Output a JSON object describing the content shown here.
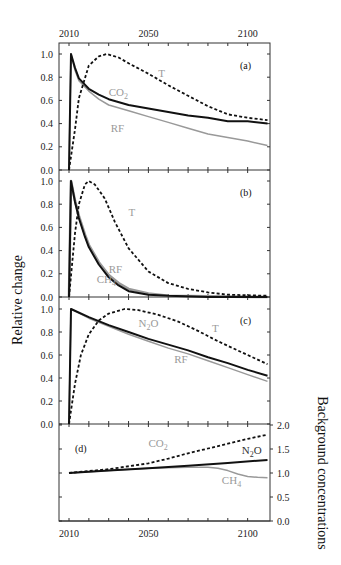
{
  "chart_data": {
    "type": "line",
    "ylabel_left": "Relative change",
    "ylabel_right": "Background concentrations",
    "xticks_top": [
      "2010",
      "2050",
      "2100"
    ],
    "xticks_bottom": [
      "2010",
      "2050",
      "2100"
    ],
    "xlim": [
      1995,
      2111
    ],
    "colors": {
      "dark": "#111111",
      "gray": "#999999"
    },
    "panels": [
      {
        "id": "a",
        "label": "(a)",
        "ylim": [
          0,
          1
        ],
        "yticks": [
          "0.0",
          "0.2",
          "0.4",
          "0.6",
          "0.8",
          "1.0"
        ],
        "series": [
          {
            "name": "RF",
            "label": "RF",
            "style": "gray-solid",
            "x": [
              2010,
              2011,
              2013,
              2015,
              2020,
              2025,
              2030,
              2040,
              2050,
              2060,
              2070,
              2080,
              2090,
              2100,
              2110
            ],
            "y": [
              0,
              1.0,
              0.86,
              0.77,
              0.68,
              0.61,
              0.56,
              0.51,
              0.46,
              0.41,
              0.36,
              0.31,
              0.28,
              0.25,
              0.21
            ]
          },
          {
            "name": "CO2",
            "label": "CO",
            "sub": "2",
            "style": "dark-solid",
            "x": [
              2010,
              2011,
              2013,
              2015,
              2020,
              2025,
              2030,
              2040,
              2050,
              2060,
              2070,
              2080,
              2090,
              2100,
              2110
            ],
            "y": [
              0,
              1.0,
              0.88,
              0.79,
              0.7,
              0.65,
              0.61,
              0.56,
              0.53,
              0.5,
              0.47,
              0.45,
              0.42,
              0.42,
              0.4
            ]
          },
          {
            "name": "T",
            "label": "T",
            "style": "dark-dashed",
            "x": [
              2010,
              2013,
              2015,
              2020,
              2025,
              2029,
              2035,
              2040,
              2050,
              2060,
              2070,
              2080,
              2090,
              2100,
              2110
            ],
            "y": [
              0,
              0.35,
              0.62,
              0.9,
              0.98,
              1.0,
              0.97,
              0.92,
              0.83,
              0.73,
              0.64,
              0.55,
              0.48,
              0.45,
              0.43
            ]
          }
        ],
        "annotations": [
          {
            "text": "T",
            "x": 2055,
            "y": 0.8,
            "color": "gray"
          },
          {
            "text": "CO",
            "sub": "2",
            "x": 2030,
            "y": 0.64,
            "color": "gray"
          },
          {
            "text": "RF",
            "x": 2031,
            "y": 0.33,
            "color": "gray"
          }
        ]
      },
      {
        "id": "b",
        "label": "(b)",
        "ylim": [
          0,
          1
        ],
        "yticks": [
          "0.0",
          "0.2",
          "0.4",
          "0.6",
          "0.8",
          "1.0"
        ],
        "series": [
          {
            "name": "RF",
            "label": "RF",
            "style": "gray-thick",
            "x": [
              2010,
              2011,
              2013,
              2015,
              2018,
              2020,
              2025,
              2030,
              2035,
              2040,
              2050,
              2060,
              2080,
              2110
            ],
            "y": [
              0,
              1.0,
              0.83,
              0.7,
              0.54,
              0.45,
              0.3,
              0.19,
              0.12,
              0.07,
              0.03,
              0.01,
              0.005,
              0.0
            ]
          },
          {
            "name": "CH4",
            "label": "CH",
            "sub": "4",
            "style": "dark-solid",
            "x": [
              2010,
              2011,
              2013,
              2015,
              2018,
              2020,
              2025,
              2030,
              2035,
              2040,
              2050,
              2060,
              2080,
              2110
            ],
            "y": [
              0,
              1.0,
              0.82,
              0.68,
              0.52,
              0.43,
              0.28,
              0.17,
              0.1,
              0.05,
              0.02,
              0.01,
              0.0,
              0.0
            ]
          },
          {
            "name": "T",
            "label": "T",
            "style": "dark-dashed",
            "x": [
              2010,
              2013,
              2015,
              2018,
              2020,
              2023,
              2028,
              2033,
              2040,
              2050,
              2060,
              2070,
              2080,
              2090,
              2110
            ],
            "y": [
              0,
              0.55,
              0.8,
              0.97,
              1.0,
              0.97,
              0.85,
              0.65,
              0.42,
              0.22,
              0.12,
              0.07,
              0.04,
              0.02,
              0.01
            ]
          }
        ],
        "annotations": [
          {
            "text": "T",
            "x": 2040,
            "y": 0.7,
            "color": "gray"
          },
          {
            "text": "RF",
            "x": 2030,
            "y": 0.21,
            "color": "gray"
          },
          {
            "text": "CH",
            "sub": "4",
            "x": 2024,
            "y": 0.12,
            "color": "gray"
          }
        ]
      },
      {
        "id": "c",
        "label": "(c)",
        "ylim": [
          0,
          1
        ],
        "yticks": [
          "0.0",
          "0.2",
          "0.4",
          "0.6",
          "0.8",
          "1.0"
        ],
        "series": [
          {
            "name": "RF",
            "label": "RF",
            "style": "gray-solid",
            "x": [
              2010,
              2011,
              2020,
              2030,
              2040,
              2050,
              2060,
              2070,
              2080,
              2090,
              2100,
              2110
            ],
            "y": [
              0,
              1.0,
              0.92,
              0.85,
              0.78,
              0.72,
              0.66,
              0.61,
              0.55,
              0.49,
              0.43,
              0.37
            ]
          },
          {
            "name": "N2O",
            "label": "N",
            "sub": "2",
            "suffix": "O",
            "style": "dark-solid",
            "x": [
              2010,
              2011,
              2020,
              2030,
              2040,
              2050,
              2060,
              2070,
              2080,
              2090,
              2100,
              2110
            ],
            "y": [
              0,
              1.0,
              0.93,
              0.86,
              0.8,
              0.74,
              0.69,
              0.64,
              0.58,
              0.53,
              0.47,
              0.42
            ]
          },
          {
            "name": "T",
            "label": "T",
            "style": "dark-dashed",
            "x": [
              2010,
              2013,
              2016,
              2020,
              2025,
              2030,
              2038,
              2045,
              2055,
              2065,
              2075,
              2085,
              2095,
              2105,
              2110
            ],
            "y": [
              0,
              0.35,
              0.6,
              0.78,
              0.9,
              0.96,
              1.0,
              0.99,
              0.95,
              0.89,
              0.81,
              0.72,
              0.64,
              0.56,
              0.52
            ]
          }
        ],
        "annotations": [
          {
            "text": "N",
            "sub": "2",
            "suffix": "O",
            "x": 2045,
            "y": 0.84,
            "color": "gray"
          },
          {
            "text": "T",
            "x": 2082,
            "y": 0.8,
            "color": "gray"
          },
          {
            "text": "RF",
            "x": 2063,
            "y": 0.53,
            "color": "gray"
          }
        ]
      },
      {
        "id": "d",
        "label": "(d)",
        "ylim": [
          0,
          2
        ],
        "yticks_right": [
          "0.0",
          "0.5",
          "1.0",
          "1.5",
          "2.0"
        ],
        "series": [
          {
            "name": "CH4",
            "label": "CH",
            "sub": "4",
            "style": "gray-solid",
            "x": [
              2010,
              2030,
              2050,
              2060,
              2070,
              2080,
              2085,
              2090,
              2095,
              2100,
              2105,
              2110
            ],
            "y": [
              1.0,
              1.05,
              1.1,
              1.11,
              1.12,
              1.12,
              1.1,
              1.05,
              0.98,
              0.93,
              0.91,
              0.9
            ]
          },
          {
            "name": "N2O",
            "label": "N",
            "sub": "2",
            "suffix": "O",
            "style": "dark-solid",
            "x": [
              2010,
              2030,
              2050,
              2070,
              2090,
              2110
            ],
            "y": [
              1.0,
              1.05,
              1.1,
              1.15,
              1.21,
              1.27
            ]
          },
          {
            "name": "CO2",
            "label": "CO",
            "sub": "2",
            "style": "dark-dashed",
            "x": [
              2010,
              2030,
              2050,
              2060,
              2070,
              2080,
              2090,
              2100,
              2110
            ],
            "y": [
              1.0,
              1.08,
              1.2,
              1.3,
              1.41,
              1.51,
              1.61,
              1.71,
              1.8
            ]
          }
        ],
        "annotations": [
          {
            "text": "CO",
            "sub": "2",
            "x": 2050,
            "y": 1.55,
            "color": "gray"
          },
          {
            "text": "N",
            "sub": "2",
            "suffix": "O",
            "x": 2097,
            "y": 1.4,
            "color": "dark"
          },
          {
            "text": "CH",
            "sub": "4",
            "x": 2087,
            "y": 0.77,
            "color": "gray"
          }
        ]
      }
    ]
  }
}
